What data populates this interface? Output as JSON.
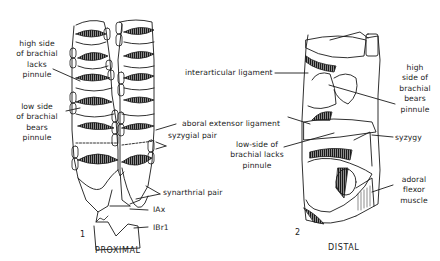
{
  "figure": {
    "panels": [
      {
        "number": "1",
        "caption": "PROXIMAL",
        "labels": {
          "high_side_lacks": [
            "high side",
            "of brachial",
            "lacks",
            "pinnule"
          ],
          "low_side_bears": [
            "low side",
            "of brachial",
            "bears",
            "pinnule"
          ],
          "aboral_extensor": "aboral extensor ligament",
          "syzygial_pair": "syzygial pair",
          "synarthrial_pair": "synarthrial pair",
          "iax": "IAx",
          "ibr1": "IBr1"
        }
      },
      {
        "number": "2",
        "caption": "DISTAL",
        "labels": {
          "interarticular": "interarticular ligament",
          "high_side_bears": [
            "high",
            "side of",
            "brachial",
            "bears",
            "pinnule"
          ],
          "low_side_lacks": [
            "low-side of",
            "brachial lacks",
            "pinnule"
          ],
          "syzygy": "syzygy",
          "adoral_flexor": [
            "adoral",
            "flexor",
            "muscle"
          ]
        }
      }
    ],
    "colors": {
      "ink": "#1a1a1a",
      "paper": "#ffffff"
    }
  }
}
